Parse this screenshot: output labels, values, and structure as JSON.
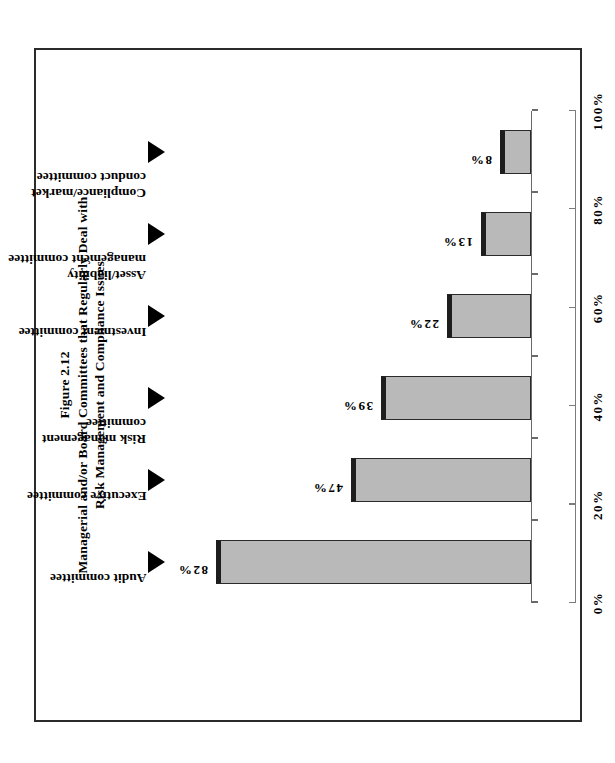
{
  "figure": {
    "number": "Figure 2.12",
    "title_line1": "Managerial and/or Board Committees that Regularly Deal with",
    "title_line2": "Risk Management and Compliance Issues"
  },
  "chart_data": {
    "type": "bar",
    "title": "Figure 2.12 Managerial and/or Board Committees that Regularly Deal with Risk Management and Compliance Issues",
    "orientation": "vertical",
    "categories": [
      "Audit committee",
      "Executive committee",
      "Risk management committee",
      "Investment committee",
      "Asset/liability management committee",
      "Compliance/market conduct committee"
    ],
    "category_lines": [
      [
        "Audit committee"
      ],
      [
        "Executive committee"
      ],
      [
        "Risk management",
        "committee"
      ],
      [
        "Investment committee"
      ],
      [
        "Asset/liability",
        "management committee"
      ],
      [
        "Compliance/market",
        "conduct committee"
      ]
    ],
    "values": [
      82,
      47,
      39,
      22,
      13,
      8
    ],
    "value_labels": [
      "82%",
      "47%",
      "39%",
      "22%",
      "13%",
      "8%"
    ],
    "xlabel": "",
    "ylabel": "% of Respondents",
    "ylim": [
      0,
      100
    ],
    "yticks": [
      0,
      20,
      40,
      60,
      80,
      100
    ],
    "ytick_labels": [
      "0%",
      "20%",
      "40%",
      "60%",
      "80%",
      "100%"
    ],
    "grid": false,
    "legend": false,
    "bar_color": "#b9b9b9",
    "bar_edge_color": "#2a2a2a",
    "bar_cap_color": "#1d1d1d",
    "axis_color": "#7d7d7d",
    "marker": "down-triangle"
  }
}
